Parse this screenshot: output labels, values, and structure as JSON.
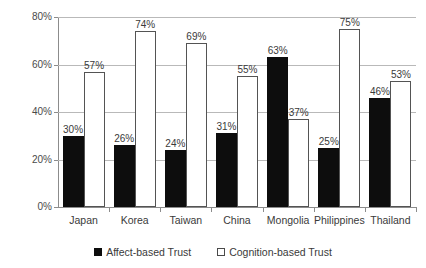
{
  "chart_data": {
    "type": "bar",
    "title": "",
    "subtitle": "",
    "xlabel": "",
    "ylabel": "",
    "ylim": [
      0,
      80
    ],
    "y_ticks": [
      "0%",
      "20%",
      "40%",
      "60%",
      "80%"
    ],
    "y_tick_values": [
      0,
      20,
      40,
      60,
      80
    ],
    "grid": true,
    "legend_position": "bottom",
    "categories": [
      "Japan",
      "Korea",
      "Taiwan",
      "China",
      "Mongolia",
      "Philippines",
      "Thailand"
    ],
    "series": [
      {
        "name": "Affect-based Trust",
        "style": "filled",
        "color": "#0d0d0d",
        "values": [
          30,
          26,
          24,
          31,
          63,
          25,
          46
        ],
        "labels": [
          "30%",
          "26%",
          "24%",
          "31%",
          "63%",
          "25%",
          "46%"
        ]
      },
      {
        "name": "Cognition-based Trust",
        "style": "hollow",
        "color": "#ffffff",
        "border_color": "#545454",
        "values": [
          57,
          74,
          69,
          55,
          37,
          75,
          53
        ],
        "labels": [
          "57%",
          "74%",
          "69%",
          "55%",
          "37%",
          "75%",
          "53%"
        ]
      }
    ]
  },
  "legend": {
    "items": [
      {
        "label": "Affect-based Trust",
        "marker": "filled-square-icon"
      },
      {
        "label": "Cognition-based Trust",
        "marker": "hollow-square-icon"
      }
    ]
  },
  "colors": {
    "affect": "#0d0d0d",
    "cognition": "#ffffff",
    "cognition_border": "#545454",
    "gridline": "#b9b9b9",
    "axis": "#8c8c8c",
    "text": "#3a3a3a",
    "background": "#ffffff"
  }
}
